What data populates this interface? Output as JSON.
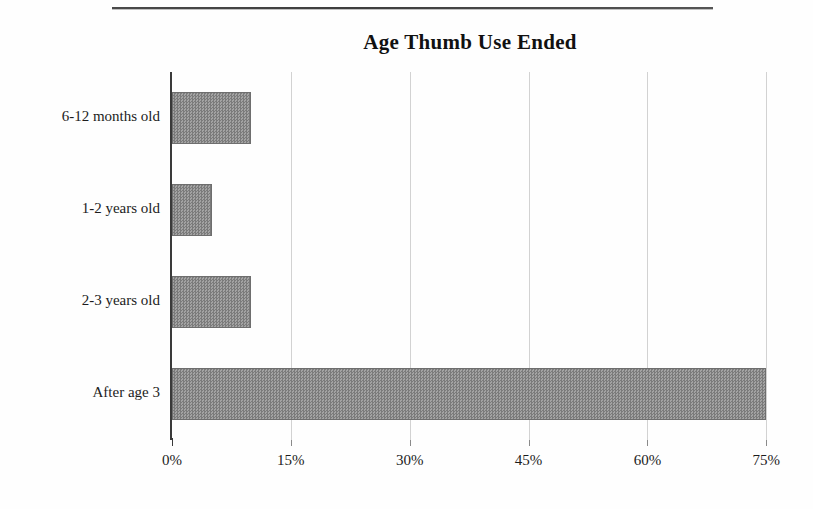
{
  "document": {
    "rule_present": true
  },
  "chart_data": {
    "type": "bar",
    "orientation": "horizontal",
    "title": "Age Thumb Use Ended",
    "xlabel": "",
    "ylabel": "",
    "categories": [
      "6-12 months old",
      "1-2 years old",
      "2-3 years old",
      "After age 3"
    ],
    "values": [
      10,
      5,
      10,
      75
    ],
    "value_labels": [
      "10%",
      "5%",
      "10%",
      "75%"
    ],
    "xlim": [
      0,
      78
    ],
    "xticks": [
      0,
      15,
      30,
      45,
      60,
      75
    ],
    "xtick_labels": [
      "0%",
      "15%",
      "30%",
      "45%",
      "60%",
      "75%"
    ],
    "grid": "vertical-only",
    "legend": null,
    "bar_fill_color": "#8d8d8d",
    "bar_border_color": "#6e6e6e",
    "gridline_color": "#d2d2d2",
    "axis_color": "#3a3a3a",
    "text_color": "#1c1c1c"
  }
}
